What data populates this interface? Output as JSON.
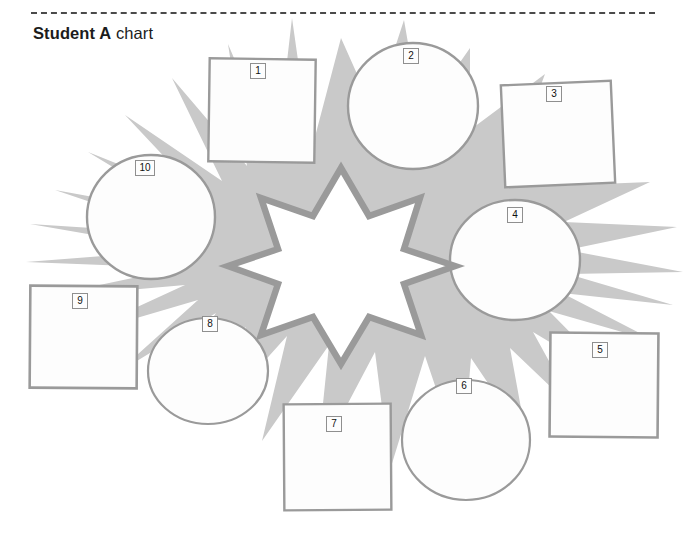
{
  "document": {
    "title_strong": "Student A",
    "title_light": " chart",
    "separator": "dashed-rule"
  },
  "palette": {
    "background": "#ffffff",
    "burst_fill": "#c9c9c9",
    "burst_fill_light": "#d6d6d6",
    "shape_fill": "#fdfdfd",
    "shape_stroke": "#9a9a9a",
    "star_stroke": "#9a9a9a",
    "star_fill": "#ffffff",
    "label_border": "#8f8f8f",
    "label_text": "#111111",
    "rule_color": "#4a4a4a",
    "title_color": "#1c1c1c"
  },
  "diagram": {
    "name": "starburst-graphic-organizer",
    "center_shape": {
      "kind": "star",
      "points": 8,
      "fill": "#ffffff",
      "stroke": "#9a9a9a"
    },
    "background_shape": {
      "kind": "explosion-burst",
      "fill": "#c9c9c9"
    },
    "nodes": [
      {
        "id": 1,
        "label": "1",
        "kind": "square",
        "x": 209,
        "y": 59,
        "w": 106,
        "h": 103,
        "rotate": 0.8
      },
      {
        "id": 2,
        "label": "2",
        "kind": "circle",
        "cx": 413,
        "cy": 106,
        "rx": 65,
        "ry": 63
      },
      {
        "id": 3,
        "label": "3",
        "kind": "square",
        "x": 503,
        "y": 83,
        "w": 110,
        "h": 102,
        "rotate": -2.5
      },
      {
        "id": 4,
        "label": "4",
        "kind": "circle",
        "cx": 515,
        "cy": 260,
        "rx": 65,
        "ry": 60
      },
      {
        "id": 5,
        "label": "5",
        "kind": "square",
        "x": 550,
        "y": 333,
        "w": 108,
        "h": 104,
        "rotate": 0.5
      },
      {
        "id": 6,
        "label": "6",
        "kind": "circle",
        "cx": 466,
        "cy": 440,
        "rx": 64,
        "ry": 60
      },
      {
        "id": 7,
        "label": "7",
        "kind": "square",
        "x": 284,
        "y": 404,
        "w": 107,
        "h": 106,
        "rotate": -0.4
      },
      {
        "id": 8,
        "label": "8",
        "kind": "circle",
        "cx": 208,
        "cy": 371,
        "rx": 60,
        "ry": 53
      },
      {
        "id": 9,
        "label": "9",
        "kind": "square",
        "x": 30,
        "y": 286,
        "w": 107,
        "h": 102,
        "rotate": 0.4
      },
      {
        "id": 10,
        "label": "10",
        "kind": "circle",
        "cx": 151,
        "cy": 217,
        "rx": 64,
        "ry": 62
      }
    ],
    "node_labels": [
      {
        "id": 1,
        "text": "1",
        "left": 250,
        "top": 63
      },
      {
        "id": 2,
        "text": "2",
        "left": 403,
        "top": 48
      },
      {
        "id": 3,
        "text": "3",
        "left": 546,
        "top": 86
      },
      {
        "id": 4,
        "text": "4",
        "left": 507,
        "top": 207
      },
      {
        "id": 5,
        "text": "5",
        "left": 592,
        "top": 342
      },
      {
        "id": 6,
        "text": "6",
        "left": 456,
        "top": 378
      },
      {
        "id": 7,
        "text": "7",
        "left": 326,
        "top": 416
      },
      {
        "id": 8,
        "text": "8",
        "left": 202,
        "top": 316
      },
      {
        "id": 9,
        "text": "9",
        "left": 72,
        "top": 293
      },
      {
        "id": 10,
        "text": "10",
        "left": 135,
        "top": 160
      }
    ]
  }
}
